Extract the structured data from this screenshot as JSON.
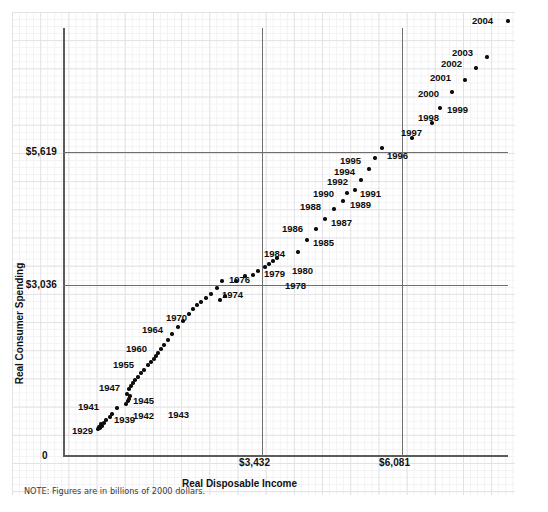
{
  "note": "NOTE: Figures are in billions of 2000 dollars.",
  "chart_data": {
    "type": "scatter",
    "title": "",
    "xlabel": "Real Disposable Income",
    "ylabel": "Real Consumer Spending",
    "grid": true,
    "legend": "none",
    "units_note": "NOTE: Figures are in billions of 2000 dollars.",
    "xlim": [
      0,
      8000
    ],
    "ylim": [
      0,
      8000
    ],
    "x_ticks": [
      "0",
      "$3,432",
      "$6,081"
    ],
    "y_ticks": [
      "0",
      "$3,036",
      "$5,619"
    ],
    "x_tick_values": [
      0,
      3432,
      6081
    ],
    "y_tick_values": [
      0,
      3036,
      5619
    ],
    "reference_lines": {
      "horizontal": [
        3036,
        5619
      ],
      "vertical": [
        3432,
        6081
      ]
    },
    "origin_label": "0",
    "points": [
      {
        "label": "1929",
        "x": 695,
        "y": 661,
        "px": 101,
        "py": 424,
        "lx": 72,
        "ly": 426,
        "labeled": true
      },
      {
        "label": "",
        "x": 640,
        "y": 607,
        "px": 99,
        "py": 427,
        "lx": 0,
        "ly": 0,
        "labeled": false
      },
      {
        "label": "",
        "x": 600,
        "y": 570,
        "px": 98,
        "py": 429,
        "lx": 0,
        "ly": 0,
        "labeled": false
      },
      {
        "label": "",
        "x": 610,
        "y": 578,
        "px": 100,
        "py": 428,
        "lx": 0,
        "ly": 0,
        "labeled": false
      },
      {
        "label": "",
        "x": 645,
        "y": 610,
        "px": 102,
        "py": 426,
        "lx": 0,
        "ly": 0,
        "labeled": false
      },
      {
        "label": "",
        "x": 690,
        "y": 650,
        "px": 104,
        "py": 423,
        "lx": 0,
        "ly": 0,
        "labeled": false
      },
      {
        "label": "",
        "x": 730,
        "y": 690,
        "px": 106,
        "py": 420,
        "lx": 0,
        "ly": 0,
        "labeled": false
      },
      {
        "label": "1939",
        "x": 790,
        "y": 733,
        "px": 110,
        "py": 417,
        "lx": 114,
        "ly": 415,
        "labeled": true
      },
      {
        "label": "",
        "x": 840,
        "y": 760,
        "px": 112,
        "py": 414,
        "lx": 0,
        "ly": 0,
        "labeled": false
      },
      {
        "label": "1941",
        "x": 940,
        "y": 820,
        "px": 117,
        "py": 408,
        "lx": 78,
        "ly": 402,
        "labeled": true
      },
      {
        "label": "1942",
        "x": 1000,
        "y": 812,
        "px": 126,
        "py": 404,
        "lx": 133,
        "ly": 411,
        "labeled": true
      },
      {
        "label": "1943",
        "x": 1030,
        "y": 838,
        "px": 128,
        "py": 401,
        "lx": 168,
        "ly": 410,
        "labeled": true
      },
      {
        "label": "",
        "x": 1060,
        "y": 858,
        "px": 129,
        "py": 399,
        "lx": 0,
        "ly": 0,
        "labeled": false
      },
      {
        "label": "1945",
        "x": 1080,
        "y": 900,
        "px": 130,
        "py": 396,
        "lx": 133,
        "ly": 396,
        "labeled": true
      },
      {
        "label": "",
        "x": 1020,
        "y": 918,
        "px": 127,
        "py": 394,
        "lx": 0,
        "ly": 0,
        "labeled": false
      },
      {
        "label": "1947",
        "x": 1030,
        "y": 931,
        "px": 129,
        "py": 389,
        "lx": 99,
        "ly": 383,
        "labeled": true
      },
      {
        "label": "",
        "x": 1050,
        "y": 945,
        "px": 131,
        "py": 386,
        "lx": 0,
        "ly": 0,
        "labeled": false
      },
      {
        "label": "",
        "x": 1090,
        "y": 970,
        "px": 133,
        "py": 383,
        "lx": 0,
        "ly": 0,
        "labeled": false
      },
      {
        "label": "",
        "x": 1120,
        "y": 992,
        "px": 135,
        "py": 380,
        "lx": 0,
        "ly": 0,
        "labeled": false
      },
      {
        "label": "",
        "x": 1180,
        "y": 1025,
        "px": 138,
        "py": 377,
        "lx": 0,
        "ly": 0,
        "labeled": false
      },
      {
        "label": "",
        "x": 1210,
        "y": 1069,
        "px": 141,
        "py": 373,
        "lx": 0,
        "ly": 0,
        "labeled": false
      },
      {
        "label": "",
        "x": 1250,
        "y": 1108,
        "px": 144,
        "py": 370,
        "lx": 0,
        "ly": 0,
        "labeled": false
      },
      {
        "label": "1955",
        "x": 1300,
        "y": 1165,
        "px": 148,
        "py": 365,
        "lx": 113,
        "ly": 360,
        "labeled": true
      },
      {
        "label": "",
        "x": 1330,
        "y": 1184,
        "px": 151,
        "py": 362,
        "lx": 0,
        "ly": 0,
        "labeled": false
      },
      {
        "label": "",
        "x": 1360,
        "y": 1205,
        "px": 154,
        "py": 359,
        "lx": 0,
        "ly": 0,
        "labeled": false
      },
      {
        "label": "",
        "x": 1390,
        "y": 1226,
        "px": 156,
        "py": 356,
        "lx": 0,
        "ly": 0,
        "labeled": false
      },
      {
        "label": "",
        "x": 1420,
        "y": 1250,
        "px": 158,
        "py": 353,
        "lx": 0,
        "ly": 0,
        "labeled": false
      },
      {
        "label": "1960",
        "x": 1460,
        "y": 1285,
        "px": 161,
        "py": 349,
        "lx": 126,
        "ly": 344,
        "labeled": true
      },
      {
        "label": "",
        "x": 1500,
        "y": 1312,
        "px": 164,
        "py": 345,
        "lx": 0,
        "ly": 0,
        "labeled": false
      },
      {
        "label": "",
        "x": 1560,
        "y": 1360,
        "px": 168,
        "py": 340,
        "lx": 0,
        "ly": 0,
        "labeled": false
      },
      {
        "label": "",
        "x": 1620,
        "y": 1419,
        "px": 172,
        "py": 334,
        "lx": 0,
        "ly": 0,
        "labeled": false
      },
      {
        "label": "1964",
        "x": 1700,
        "y": 1497,
        "px": 178,
        "py": 327,
        "lx": 142,
        "ly": 325,
        "labeled": true
      },
      {
        "label": "",
        "x": 1790,
        "y": 1578,
        "px": 183,
        "py": 321,
        "lx": 0,
        "ly": 0,
        "labeled": false
      },
      {
        "label": "",
        "x": 1880,
        "y": 1666,
        "px": 189,
        "py": 314,
        "lx": 0,
        "ly": 0,
        "labeled": false
      },
      {
        "label": "",
        "x": 1960,
        "y": 1724,
        "px": 193,
        "py": 309,
        "lx": 0,
        "ly": 0,
        "labeled": false
      },
      {
        "label": "",
        "x": 2020,
        "y": 1778,
        "px": 197,
        "py": 305,
        "lx": 0,
        "ly": 0,
        "labeled": false
      },
      {
        "label": "",
        "x": 2100,
        "y": 1813,
        "px": 201,
        "py": 302,
        "lx": 0,
        "ly": 0,
        "labeled": false
      },
      {
        "label": "1970",
        "x": 2160,
        "y": 1874,
        "px": 206,
        "py": 298,
        "lx": 166,
        "ly": 313,
        "labeled": true
      },
      {
        "label": "",
        "x": 2220,
        "y": 1929,
        "px": 211,
        "py": 294,
        "lx": 0,
        "ly": 0,
        "labeled": false
      },
      {
        "label": "",
        "x": 2330,
        "y": 2040,
        "px": 217,
        "py": 288,
        "lx": 0,
        "ly": 0,
        "labeled": false
      },
      {
        "label": "",
        "x": 2420,
        "y": 2124,
        "px": 222,
        "py": 281,
        "lx": 0,
        "ly": 0,
        "labeled": false
      },
      {
        "label": "1974",
        "x": 2400,
        "y": 2106,
        "px": 220,
        "py": 300,
        "lx": 222,
        "ly": 290,
        "labeled": true
      },
      {
        "label": "",
        "x": 2430,
        "y": 2121,
        "px": 225,
        "py": 296,
        "lx": 0,
        "ly": 0,
        "labeled": false
      },
      {
        "label": "1976",
        "x": 2520,
        "y": 2221,
        "px": 236,
        "py": 281,
        "lx": 229,
        "ly": 275,
        "labeled": true
      },
      {
        "label": "",
        "x": 2580,
        "y": 2285,
        "px": 245,
        "py": 276,
        "lx": 0,
        "ly": 0,
        "labeled": false
      },
      {
        "label": "1978",
        "x": 2670,
        "y": 2368,
        "px": 253,
        "py": 275,
        "lx": 285,
        "ly": 281,
        "labeled": true
      },
      {
        "label": "1979",
        "x": 2740,
        "y": 2400,
        "px": 258,
        "py": 271,
        "lx": 264,
        "ly": 269,
        "labeled": true
      },
      {
        "label": "1980",
        "x": 2720,
        "y": 2375,
        "px": 265,
        "py": 267,
        "lx": 292,
        "ly": 266,
        "labeled": true
      },
      {
        "label": "",
        "x": 2780,
        "y": 2400,
        "px": 269,
        "py": 264,
        "lx": 0,
        "ly": 0,
        "labeled": false
      },
      {
        "label": "",
        "x": 2800,
        "y": 2410,
        "px": 273,
        "py": 261,
        "lx": 0,
        "ly": 0,
        "labeled": false
      },
      {
        "label": "",
        "x": 2860,
        "y": 2450,
        "px": 277,
        "py": 258,
        "lx": 0,
        "ly": 0,
        "labeled": false
      },
      {
        "label": "1984",
        "x": 3100,
        "y": 2670,
        "px": 298,
        "py": 252,
        "lx": 264,
        "ly": 249,
        "labeled": true
      },
      {
        "label": "1985",
        "x": 3200,
        "y": 2800,
        "px": 307,
        "py": 240,
        "lx": 313,
        "ly": 238,
        "labeled": true
      },
      {
        "label": "1986",
        "x": 3300,
        "y": 2900,
        "px": 316,
        "py": 229,
        "lx": 282,
        "ly": 224,
        "labeled": true
      },
      {
        "label": "1987",
        "x": 3400,
        "y": 2990,
        "px": 325,
        "py": 219,
        "lx": 331,
        "ly": 218,
        "labeled": true
      },
      {
        "label": "1988",
        "x": 3500,
        "y": 3100,
        "px": 334,
        "py": 209,
        "lx": 300,
        "ly": 202,
        "labeled": true
      },
      {
        "label": "1989",
        "x": 3600,
        "y": 3170,
        "px": 343,
        "py": 201,
        "lx": 350,
        "ly": 200,
        "labeled": true
      },
      {
        "label": "1990",
        "x": 3650,
        "y": 3200,
        "px": 347,
        "py": 193,
        "lx": 313,
        "ly": 189,
        "labeled": true
      },
      {
        "label": "1991",
        "x": 3690,
        "y": 3180,
        "px": 355,
        "py": 190,
        "lx": 360,
        "ly": 189,
        "labeled": true
      },
      {
        "label": "1992",
        "x": 3800,
        "y": 3250,
        "px": 361,
        "py": 180,
        "lx": 327,
        "ly": 177,
        "labeled": true
      },
      {
        "label": "1994",
        "x": 3950,
        "y": 3400,
        "px": 369,
        "py": 169,
        "lx": 334,
        "ly": 167,
        "labeled": true
      },
      {
        "label": "1995",
        "x": 4050,
        "y": 3500,
        "px": 375,
        "py": 158,
        "lx": 340,
        "ly": 156,
        "labeled": true
      },
      {
        "label": "1996",
        "x": 4150,
        "y": 3600,
        "px": 382,
        "py": 148,
        "lx": 387,
        "ly": 151,
        "labeled": true
      },
      {
        "label": "1997",
        "x": 4300,
        "y": 3750,
        "px": 412,
        "py": 138,
        "lx": 401,
        "ly": 128,
        "labeled": true
      },
      {
        "label": "1998",
        "x": 4450,
        "y": 3950,
        "px": 432,
        "py": 123,
        "lx": 418,
        "ly": 113,
        "labeled": true
      },
      {
        "label": "1999",
        "x": 4600,
        "y": 4150,
        "px": 440,
        "py": 108,
        "lx": 447,
        "ly": 105,
        "labeled": true
      },
      {
        "label": "2000",
        "x": 4750,
        "y": 4350,
        "px": 452,
        "py": 92,
        "lx": 418,
        "ly": 89,
        "labeled": true
      },
      {
        "label": "2001",
        "x": 4850,
        "y": 4450,
        "px": 465,
        "py": 80,
        "lx": 430,
        "ly": 73,
        "labeled": true
      },
      {
        "label": "2002",
        "x": 4950,
        "y": 4570,
        "px": 476,
        "py": 68,
        "lx": 441,
        "ly": 59,
        "labeled": true
      },
      {
        "label": "2003",
        "x": 5050,
        "y": 4700,
        "px": 487,
        "py": 57,
        "lx": 452,
        "ly": 48,
        "labeled": true
      },
      {
        "label": "2004",
        "x": 5200,
        "y": 4900,
        "px": 508,
        "py": 21,
        "lx": 472,
        "ly": 16,
        "labeled": true
      }
    ]
  }
}
